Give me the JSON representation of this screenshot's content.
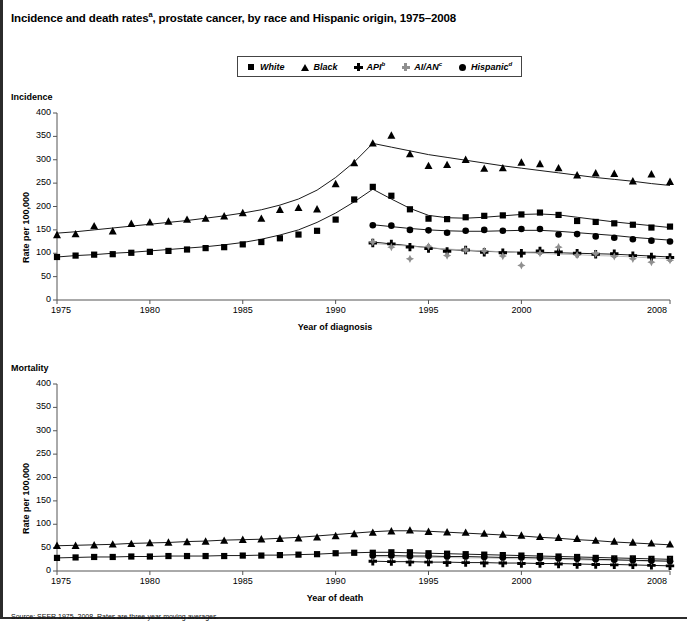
{
  "title": "Incidence and death rates",
  "title_sup": "a",
  "title_rest": ", prostate cancer, by race and Hispanic origin, 1975–2008",
  "legend": {
    "items": [
      {
        "label": "White",
        "sup": "",
        "icon": "square-marker-icon",
        "color": "#000000"
      },
      {
        "label": "Black",
        "sup": "",
        "icon": "triangle-marker-icon",
        "color": "#000000"
      },
      {
        "label": "API",
        "sup": "b",
        "icon": "plus-marker-icon",
        "color": "#000000"
      },
      {
        "label": "AI/AN",
        "sup": "c",
        "icon": "diamond-marker-icon",
        "color": "#8f8f8f"
      },
      {
        "label": "Hispanic",
        "sup": "d",
        "icon": "circle-marker-icon",
        "color": "#000000"
      }
    ]
  },
  "panels": [
    {
      "name": "Incidence",
      "ylabel": "Rate per 100,000",
      "xlabel": "Year of diagnosis"
    },
    {
      "name": "Mortality",
      "ylabel": "Rate per 100,000",
      "xlabel": "Year of death"
    }
  ],
  "axis": {
    "yticks": [
      "0",
      "50",
      "100",
      "150",
      "200",
      "250",
      "300",
      "350",
      "400"
    ],
    "xticks": [
      "1975",
      "1980",
      "1985",
      "1990",
      "1995",
      "2000",
      "2008"
    ]
  },
  "footnote": "Source: SEER 1975–2008. Rates are three-year moving averages.",
  "chart_data": [
    {
      "type": "line",
      "title": "Incidence",
      "xlabel": "Year of diagnosis",
      "ylabel": "Rate per 100,000",
      "xlim": [
        1975,
        2008
      ],
      "ylim": [
        0,
        400
      ],
      "ytick_values": [
        0,
        50,
        100,
        150,
        200,
        250,
        300,
        350,
        400
      ],
      "xtick_values": [
        1975,
        1980,
        1985,
        1990,
        1995,
        2000,
        2008
      ],
      "grid": false,
      "legend_position": "top-center",
      "series": [
        {
          "name": "White",
          "marker": "square",
          "color": "#000000",
          "x": [
            1975,
            1976,
            1977,
            1978,
            1979,
            1980,
            1981,
            1982,
            1983,
            1984,
            1985,
            1986,
            1987,
            1988,
            1989,
            1990,
            1991,
            1992,
            1993,
            1994,
            1995,
            1996,
            1997,
            1998,
            1999,
            2000,
            2001,
            2002,
            2003,
            2004,
            2005,
            2006,
            2007,
            2008
          ],
          "values": [
            92,
            95,
            97,
            98,
            101,
            103,
            105,
            108,
            111,
            113,
            119,
            124,
            132,
            140,
            148,
            172,
            215,
            242,
            223,
            194,
            174,
            173,
            177,
            180,
            181,
            183,
            187,
            182,
            169,
            167,
            164,
            161,
            155,
            157
          ],
          "trend": [
            92,
            95,
            97,
            100,
            102,
            105,
            108,
            111,
            114,
            118,
            123,
            130,
            139,
            150,
            166,
            186,
            210,
            237,
            216,
            196,
            181,
            176,
            175,
            177,
            180,
            183,
            184,
            182,
            177,
            172,
            167,
            163,
            159,
            155
          ]
        },
        {
          "name": "Black",
          "marker": "triangle",
          "color": "#000000",
          "x": [
            1975,
            1976,
            1977,
            1978,
            1979,
            1980,
            1981,
            1982,
            1983,
            1984,
            1985,
            1986,
            1987,
            1988,
            1989,
            1990,
            1991,
            1992,
            1993,
            1994,
            1995,
            1996,
            1997,
            1998,
            1999,
            2000,
            2001,
            2002,
            2003,
            2004,
            2005,
            2006,
            2007,
            2008
          ],
          "values": [
            139,
            141,
            158,
            147,
            163,
            166,
            168,
            172,
            174,
            179,
            186,
            174,
            193,
            197,
            194,
            248,
            293,
            335,
            352,
            312,
            287,
            289,
            300,
            281,
            282,
            294,
            291,
            282,
            267,
            271,
            270,
            254,
            269,
            253
          ],
          "trend": [
            143,
            146,
            150,
            154,
            158,
            162,
            166,
            170,
            175,
            180,
            186,
            193,
            203,
            216,
            235,
            262,
            295,
            335,
            327,
            319,
            311,
            305,
            299,
            293,
            287,
            282,
            277,
            272,
            267,
            262,
            258,
            254,
            249,
            245
          ]
        },
        {
          "name": "API",
          "marker": "plus",
          "color": "#000000",
          "x": [
            1992,
            1993,
            1994,
            1995,
            1996,
            1997,
            1998,
            1999,
            2000,
            2001,
            2002,
            2003,
            2004,
            2005,
            2006,
            2007,
            2008
          ],
          "values": [
            122,
            120,
            113,
            110,
            104,
            107,
            102,
            101,
            100,
            105,
            103,
            100,
            98,
            99,
            95,
            92,
            91
          ],
          "trend": [
            124,
            120,
            116,
            112,
            108,
            106,
            104,
            103,
            102,
            102,
            101,
            100,
            99,
            98,
            96,
            94,
            92
          ]
        },
        {
          "name": "AI/AN",
          "marker": "diamond",
          "color": "#8f8f8f",
          "x": [
            1992,
            1993,
            1994,
            1995,
            1996,
            1997,
            1998,
            1999,
            2000,
            2001,
            2002,
            2003,
            2004,
            2005,
            2006,
            2007,
            2008
          ],
          "values": [
            124,
            113,
            88,
            115,
            95,
            107,
            105,
            94,
            74,
            100,
            113,
            96,
            99,
            93,
            88,
            81,
            85
          ],
          "trend": [
            121,
            118,
            115,
            112,
            109,
            107,
            105,
            103,
            101,
            100,
            98,
            97,
            95,
            94,
            92,
            90,
            88
          ]
        },
        {
          "name": "Hispanic",
          "marker": "circle",
          "color": "#000000",
          "x": [
            1992,
            1993,
            1994,
            1995,
            1996,
            1997,
            1998,
            1999,
            2000,
            2001,
            2002,
            2003,
            2004,
            2005,
            2006,
            2007,
            2008
          ],
          "values": [
            160,
            159,
            150,
            149,
            144,
            148,
            150,
            148,
            152,
            152,
            140,
            141,
            136,
            133,
            130,
            127,
            125
          ],
          "trend": [
            161,
            157,
            153,
            150,
            148,
            147,
            147,
            148,
            149,
            149,
            147,
            144,
            141,
            138,
            134,
            131,
            128
          ]
        }
      ]
    },
    {
      "type": "line",
      "title": "Mortality",
      "xlabel": "Year of death",
      "ylabel": "Rate per 100,000",
      "xlim": [
        1975,
        2008
      ],
      "ylim": [
        0,
        400
      ],
      "ytick_values": [
        0,
        50,
        100,
        150,
        200,
        250,
        300,
        350,
        400
      ],
      "xtick_values": [
        1975,
        1980,
        1985,
        1990,
        1995,
        2000,
        2008
      ],
      "grid": false,
      "legend_position": "top-center",
      "series": [
        {
          "name": "White",
          "marker": "square",
          "color": "#000000",
          "x": [
            1975,
            1976,
            1977,
            1978,
            1979,
            1980,
            1981,
            1982,
            1983,
            1984,
            1985,
            1986,
            1987,
            1988,
            1989,
            1990,
            1991,
            1992,
            1993,
            1994,
            1995,
            1996,
            1997,
            1998,
            1999,
            2000,
            2001,
            2002,
            2003,
            2004,
            2005,
            2006,
            2007,
            2008
          ],
          "values": [
            28,
            29,
            30,
            30,
            31,
            31,
            32,
            32,
            32,
            32,
            33,
            33,
            34,
            35,
            36,
            38,
            39,
            39,
            40,
            40,
            38,
            37,
            36,
            35,
            34,
            33,
            32,
            31,
            30,
            28,
            27,
            27,
            26,
            26
          ],
          "trend": [
            28,
            29,
            30,
            30,
            31,
            31,
            32,
            32,
            32,
            33,
            33,
            34,
            34,
            35,
            36,
            38,
            39,
            40,
            40,
            39,
            38,
            37,
            36,
            35,
            34,
            33,
            32,
            31,
            30,
            29,
            28,
            27,
            26,
            25
          ]
        },
        {
          "name": "Black",
          "marker": "triangle",
          "color": "#000000",
          "x": [
            1975,
            1976,
            1977,
            1978,
            1979,
            1980,
            1981,
            1982,
            1983,
            1984,
            1985,
            1986,
            1987,
            1988,
            1989,
            1990,
            1991,
            1992,
            1993,
            1994,
            1995,
            1996,
            1997,
            1998,
            1999,
            2000,
            2001,
            2002,
            2003,
            2004,
            2005,
            2006,
            2007,
            2008
          ],
          "values": [
            54,
            54,
            55,
            57,
            58,
            60,
            61,
            62,
            63,
            65,
            67,
            68,
            69,
            70,
            72,
            75,
            79,
            82,
            85,
            87,
            84,
            83,
            82,
            80,
            78,
            76,
            73,
            71,
            69,
            65,
            63,
            61,
            59,
            57
          ],
          "trend": [
            54,
            55,
            56,
            57,
            59,
            60,
            61,
            63,
            64,
            66,
            67,
            68,
            70,
            72,
            75,
            78,
            81,
            84,
            86,
            86,
            85,
            83,
            81,
            79,
            77,
            75,
            72,
            70,
            67,
            65,
            62,
            60,
            58,
            56
          ]
        },
        {
          "name": "API",
          "marker": "plus",
          "color": "#000000",
          "x": [
            1992,
            1993,
            1994,
            1995,
            1996,
            1997,
            1998,
            1999,
            2000,
            2001,
            2002,
            2003,
            2004,
            2005,
            2006,
            2007,
            2008
          ],
          "values": [
            21,
            20,
            19,
            19,
            18,
            18,
            17,
            17,
            16,
            16,
            15,
            14,
            14,
            13,
            13,
            12,
            11
          ],
          "trend": [
            21,
            20,
            20,
            19,
            19,
            18,
            18,
            17,
            17,
            16,
            16,
            15,
            14,
            14,
            13,
            12,
            11
          ]
        },
        {
          "name": "AI/AN",
          "marker": "diamond",
          "color": "#8f8f8f",
          "x": [
            1992,
            1993,
            1994,
            1995,
            1996,
            1997,
            1998,
            1999,
            2000,
            2001,
            2002,
            2003,
            2004,
            2005,
            2006,
            2007,
            2008
          ],
          "values": [
            30,
            30,
            29,
            29,
            29,
            28,
            28,
            27,
            26,
            26,
            25,
            24,
            23,
            23,
            22,
            21,
            21
          ],
          "trend": [
            31,
            30,
            30,
            29,
            29,
            28,
            28,
            27,
            26,
            26,
            25,
            24,
            23,
            23,
            22,
            21,
            21
          ]
        },
        {
          "name": "Hispanic",
          "marker": "circle",
          "color": "#000000",
          "x": [
            1992,
            1993,
            1994,
            1995,
            1996,
            1997,
            1998,
            1999,
            2000,
            2001,
            2002,
            2003,
            2004,
            2005,
            2006,
            2007,
            2008
          ],
          "values": [
            33,
            33,
            32,
            32,
            31,
            31,
            30,
            29,
            29,
            28,
            27,
            26,
            25,
            24,
            23,
            22,
            21
          ],
          "trend": [
            33,
            33,
            32,
            32,
            31,
            31,
            30,
            29,
            29,
            28,
            27,
            26,
            25,
            24,
            23,
            22,
            21
          ]
        }
      ]
    }
  ]
}
